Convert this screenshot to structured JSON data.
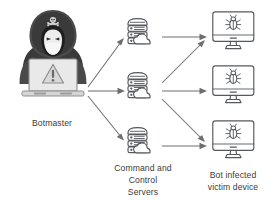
{
  "diagram": {
    "type": "network-diagram",
    "background_color": "#ffffff",
    "edge_color": "#6e6e6e",
    "icon_stroke_color": "#55585c",
    "label_color": "#3b3b3b",
    "hood_color": "#3a3a3a",
    "labels": {
      "botmaster": "Botmaster",
      "servers_line1": "Command and",
      "servers_line2": "Control",
      "servers_line3": "Servers",
      "victims_line1": "Bot infected",
      "victims_line2": "victim device"
    },
    "nodes": {
      "botmaster": {
        "name": "Botmaster",
        "icon": "hooded-hacker-with-laptop",
        "emblem": "skull-and-crossbones",
        "screen_symbol": "warning-triangle"
      },
      "servers": [
        {
          "name": "Command and Control Server 1",
          "icon": "cloud-server-stack"
        },
        {
          "name": "Command and Control Server 2",
          "icon": "cloud-server-stack"
        },
        {
          "name": "Command and Control Server 3",
          "icon": "cloud-server-stack"
        }
      ],
      "victims": [
        {
          "name": "Bot infected victim device 1",
          "icon": "monitor-with-bug"
        },
        {
          "name": "Bot infected victim device 2",
          "icon": "monitor-with-bug"
        },
        {
          "name": "Bot infected victim device 3",
          "icon": "monitor-with-bug"
        }
      ]
    },
    "edges": [
      {
        "from": "botmaster",
        "to": "server-1",
        "style": "diagonal-up"
      },
      {
        "from": "botmaster",
        "to": "server-2",
        "style": "horizontal"
      },
      {
        "from": "botmaster",
        "to": "server-3",
        "style": "diagonal-down"
      },
      {
        "from": "server-1",
        "to": "victim-1",
        "style": "horizontal"
      },
      {
        "from": "server-2",
        "to": "victim-1",
        "style": "diagonal-up"
      },
      {
        "from": "server-2",
        "to": "victim-2",
        "style": "horizontal"
      },
      {
        "from": "server-2",
        "to": "victim-3",
        "style": "diagonal-down"
      },
      {
        "from": "server-3",
        "to": "victim-3",
        "style": "horizontal"
      }
    ]
  }
}
